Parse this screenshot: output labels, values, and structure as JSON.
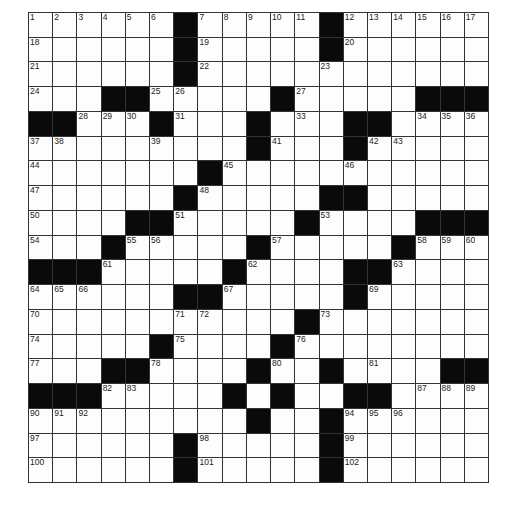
{
  "puzzle": {
    "rows": 19,
    "cols": 19,
    "grid": [
      "......#.....#......",
      "......#.....#......",
      "......#............",
      "...##.....#.....###",
      "##...#...#...##....",
      ".........#...#.....",
      ".......#...........",
      "......#.....##.....",
      "....##.....#....###",
      "...#.....#.....#...",
      "###.....#....##....",
      "......##.....#.....",
      "...........#.......",
      ".....#....#........",
      "...##....#..#....##",
      "###.....#.#..##....",
      ".........#..#......",
      "......#.....#......",
      "......#.....#......"
    ],
    "numbers": [
      [
        0,
        0,
        1
      ],
      [
        0,
        1,
        2
      ],
      [
        0,
        2,
        3
      ],
      [
        0,
        3,
        4
      ],
      [
        0,
        4,
        5
      ],
      [
        0,
        5,
        6
      ],
      [
        0,
        7,
        7
      ],
      [
        0,
        8,
        8
      ],
      [
        0,
        9,
        9
      ],
      [
        0,
        10,
        10
      ],
      [
        0,
        11,
        11
      ],
      [
        0,
        13,
        12
      ],
      [
        0,
        14,
        13
      ],
      [
        0,
        15,
        14
      ],
      [
        0,
        16,
        15
      ],
      [
        0,
        17,
        16
      ],
      [
        0,
        18,
        17
      ],
      [
        1,
        0,
        18
      ],
      [
        1,
        7,
        19
      ],
      [
        1,
        13,
        20
      ],
      [
        2,
        0,
        21
      ],
      [
        2,
        7,
        22
      ],
      [
        2,
        12,
        23
      ],
      [
        3,
        0,
        24
      ],
      [
        3,
        5,
        25
      ],
      [
        3,
        6,
        26
      ],
      [
        3,
        11,
        27
      ],
      [
        4,
        2,
        28
      ],
      [
        4,
        3,
        29
      ],
      [
        4,
        4,
        30
      ],
      [
        4,
        6,
        31
      ],
      [
        4,
        9,
        32
      ],
      [
        4,
        11,
        33
      ],
      [
        4,
        16,
        34
      ],
      [
        4,
        17,
        35
      ],
      [
        4,
        18,
        36
      ],
      [
        5,
        0,
        37
      ],
      [
        5,
        1,
        38
      ],
      [
        5,
        5,
        39
      ],
      [
        5,
        9,
        40
      ],
      [
        5,
        10,
        41
      ],
      [
        5,
        14,
        42
      ],
      [
        5,
        15,
        43
      ],
      [
        6,
        0,
        44
      ],
      [
        6,
        8,
        45
      ],
      [
        6,
        13,
        46
      ],
      [
        7,
        0,
        47
      ],
      [
        7,
        7,
        48
      ],
      [
        7,
        13,
        49
      ],
      [
        8,
        0,
        50
      ],
      [
        8,
        6,
        51
      ],
      [
        8,
        11,
        52
      ],
      [
        8,
        12,
        53
      ],
      [
        9,
        0,
        54
      ],
      [
        9,
        4,
        55
      ],
      [
        9,
        5,
        56
      ],
      [
        9,
        10,
        57
      ],
      [
        9,
        16,
        58
      ],
      [
        9,
        17,
        59
      ],
      [
        9,
        18,
        60
      ],
      [
        10,
        3,
        61
      ],
      [
        10,
        9,
        62
      ],
      [
        10,
        15,
        63
      ],
      [
        11,
        0,
        64
      ],
      [
        11,
        1,
        65
      ],
      [
        11,
        2,
        66
      ],
      [
        11,
        8,
        67
      ],
      [
        11,
        13,
        68
      ],
      [
        11,
        14,
        69
      ],
      [
        12,
        0,
        70
      ],
      [
        12,
        6,
        71
      ],
      [
        12,
        7,
        72
      ],
      [
        12,
        12,
        73
      ],
      [
        13,
        0,
        74
      ],
      [
        13,
        6,
        75
      ],
      [
        13,
        11,
        76
      ],
      [
        14,
        0,
        77
      ],
      [
        14,
        5,
        78
      ],
      [
        14,
        9,
        79
      ],
      [
        14,
        10,
        80
      ],
      [
        14,
        14,
        81
      ],
      [
        15,
        3,
        82
      ],
      [
        15,
        4,
        83
      ],
      [
        15,
        8,
        84
      ],
      [
        15,
        10,
        85
      ],
      [
        15,
        13,
        86
      ],
      [
        15,
        16,
        87
      ],
      [
        15,
        17,
        88
      ],
      [
        15,
        18,
        89
      ],
      [
        16,
        0,
        90
      ],
      [
        16,
        1,
        91
      ],
      [
        16,
        2,
        92
      ],
      [
        16,
        9,
        93
      ],
      [
        16,
        13,
        94
      ],
      [
        16,
        14,
        95
      ],
      [
        16,
        15,
        96
      ],
      [
        17,
        0,
        97
      ],
      [
        17,
        7,
        98
      ],
      [
        17,
        13,
        99
      ],
      [
        18,
        0,
        100
      ],
      [
        18,
        7,
        101
      ],
      [
        18,
        13,
        102
      ]
    ]
  }
}
